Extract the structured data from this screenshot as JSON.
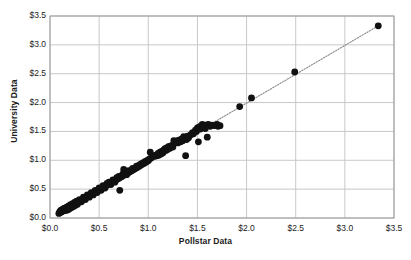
{
  "chart_data": {
    "type": "scatter",
    "title": "",
    "xlabel": "Pollstar Data",
    "ylabel": "University Data",
    "xlim": [
      0,
      3.5
    ],
    "ylim": [
      0,
      3.5
    ],
    "xticks": [
      "$0.0",
      "$0.5",
      "$1.0",
      "$1.5",
      "$2.0",
      "$2.5",
      "$3.0",
      "$3.5"
    ],
    "yticks": [
      "$0.0",
      "$0.5",
      "$1.0",
      "$1.5",
      "$2.0",
      "$2.5",
      "$3.0",
      "$3.5"
    ],
    "xtick_values": [
      0,
      0.5,
      1.0,
      1.5,
      2.0,
      2.5,
      3.0,
      3.5
    ],
    "ytick_values": [
      0,
      0.5,
      1.0,
      1.5,
      2.0,
      2.5,
      3.0,
      3.5
    ],
    "grid": true,
    "legend": "none",
    "marker_color": "#111111",
    "marker_size": 3.4,
    "gridline_color": "#c8c8c8",
    "axis_color": "#9a9a9a",
    "trendline": {
      "style": "dotted",
      "color": "#8c8c8c",
      "x": [
        0.08,
        3.36
      ],
      "y": [
        0.07,
        3.35
      ]
    },
    "series": [
      {
        "name": "Pollstar vs University",
        "points": [
          [
            0.09,
            0.08
          ],
          [
            0.1,
            0.09
          ],
          [
            0.1,
            0.11
          ],
          [
            0.11,
            0.1
          ],
          [
            0.11,
            0.13
          ],
          [
            0.12,
            0.11
          ],
          [
            0.12,
            0.14
          ],
          [
            0.13,
            0.12
          ],
          [
            0.13,
            0.15
          ],
          [
            0.14,
            0.13
          ],
          [
            0.14,
            0.16
          ],
          [
            0.15,
            0.14
          ],
          [
            0.15,
            0.17
          ],
          [
            0.16,
            0.15
          ],
          [
            0.16,
            0.13
          ],
          [
            0.17,
            0.16
          ],
          [
            0.17,
            0.19
          ],
          [
            0.18,
            0.17
          ],
          [
            0.18,
            0.14
          ],
          [
            0.19,
            0.18
          ],
          [
            0.19,
            0.21
          ],
          [
            0.2,
            0.19
          ],
          [
            0.2,
            0.16
          ],
          [
            0.21,
            0.2
          ],
          [
            0.21,
            0.23
          ],
          [
            0.22,
            0.21
          ],
          [
            0.22,
            0.18
          ],
          [
            0.23,
            0.22
          ],
          [
            0.23,
            0.25
          ],
          [
            0.24,
            0.23
          ],
          [
            0.24,
            0.2
          ],
          [
            0.25,
            0.24
          ],
          [
            0.25,
            0.27
          ],
          [
            0.26,
            0.25
          ],
          [
            0.26,
            0.22
          ],
          [
            0.27,
            0.26
          ],
          [
            0.27,
            0.29
          ],
          [
            0.28,
            0.27
          ],
          [
            0.28,
            0.24
          ],
          [
            0.29,
            0.28
          ],
          [
            0.3,
            0.29
          ],
          [
            0.3,
            0.32
          ],
          [
            0.31,
            0.3
          ],
          [
            0.32,
            0.31
          ],
          [
            0.32,
            0.28
          ],
          [
            0.33,
            0.32
          ],
          [
            0.34,
            0.33
          ],
          [
            0.34,
            0.36
          ],
          [
            0.35,
            0.34
          ],
          [
            0.36,
            0.35
          ],
          [
            0.36,
            0.32
          ],
          [
            0.37,
            0.36
          ],
          [
            0.38,
            0.37
          ],
          [
            0.38,
            0.4
          ],
          [
            0.39,
            0.38
          ],
          [
            0.4,
            0.39
          ],
          [
            0.4,
            0.36
          ],
          [
            0.41,
            0.4
          ],
          [
            0.42,
            0.41
          ],
          [
            0.42,
            0.44
          ],
          [
            0.43,
            0.42
          ],
          [
            0.44,
            0.43
          ],
          [
            0.44,
            0.4
          ],
          [
            0.45,
            0.44
          ],
          [
            0.46,
            0.45
          ],
          [
            0.46,
            0.48
          ],
          [
            0.47,
            0.46
          ],
          [
            0.48,
            0.47
          ],
          [
            0.48,
            0.44
          ],
          [
            0.49,
            0.48
          ],
          [
            0.5,
            0.49
          ],
          [
            0.5,
            0.52
          ],
          [
            0.51,
            0.5
          ],
          [
            0.52,
            0.51
          ],
          [
            0.52,
            0.48
          ],
          [
            0.53,
            0.52
          ],
          [
            0.54,
            0.53
          ],
          [
            0.54,
            0.56
          ],
          [
            0.55,
            0.54
          ],
          [
            0.56,
            0.55
          ],
          [
            0.56,
            0.52
          ],
          [
            0.57,
            0.56
          ],
          [
            0.58,
            0.57
          ],
          [
            0.58,
            0.6
          ],
          [
            0.59,
            0.58
          ],
          [
            0.6,
            0.59
          ],
          [
            0.6,
            0.62
          ],
          [
            0.61,
            0.6
          ],
          [
            0.62,
            0.61
          ],
          [
            0.62,
            0.58
          ],
          [
            0.63,
            0.62
          ],
          [
            0.64,
            0.63
          ],
          [
            0.64,
            0.66
          ],
          [
            0.65,
            0.64
          ],
          [
            0.66,
            0.65
          ],
          [
            0.66,
            0.62
          ],
          [
            0.67,
            0.66
          ],
          [
            0.68,
            0.67
          ],
          [
            0.68,
            0.7
          ],
          [
            0.69,
            0.68
          ],
          [
            0.7,
            0.69
          ],
          [
            0.7,
            0.72
          ],
          [
            0.71,
            0.7
          ],
          [
            0.71,
            0.48
          ],
          [
            0.72,
            0.71
          ],
          [
            0.73,
            0.72
          ],
          [
            0.74,
            0.73
          ],
          [
            0.74,
            0.76
          ],
          [
            0.75,
            0.84
          ],
          [
            0.75,
            0.74
          ],
          [
            0.76,
            0.78
          ],
          [
            0.77,
            0.76
          ],
          [
            0.78,
            0.79
          ],
          [
            0.78,
            0.75
          ],
          [
            0.79,
            0.78
          ],
          [
            0.8,
            0.79
          ],
          [
            0.8,
            0.82
          ],
          [
            0.81,
            0.8
          ],
          [
            0.82,
            0.81
          ],
          [
            0.83,
            0.82
          ],
          [
            0.84,
            0.83
          ],
          [
            0.84,
            0.86
          ],
          [
            0.85,
            0.84
          ],
          [
            0.86,
            0.85
          ],
          [
            0.87,
            0.86
          ],
          [
            0.88,
            0.87
          ],
          [
            0.88,
            0.9
          ],
          [
            0.89,
            0.88
          ],
          [
            0.9,
            0.89
          ],
          [
            0.91,
            0.92
          ],
          [
            0.92,
            0.91
          ],
          [
            0.93,
            0.94
          ],
          [
            0.94,
            0.93
          ],
          [
            0.95,
            0.96
          ],
          [
            0.96,
            0.95
          ],
          [
            0.97,
            0.98
          ],
          [
            0.98,
            0.97
          ],
          [
            0.99,
            1.0
          ],
          [
            1.0,
            0.99
          ],
          [
            1.01,
            1.02
          ],
          [
            1.02,
            1.14
          ],
          [
            1.03,
            1.04
          ],
          [
            1.04,
            1.06
          ],
          [
            1.06,
            1.08
          ],
          [
            1.07,
            1.07
          ],
          [
            1.08,
            1.09
          ],
          [
            1.09,
            1.08
          ],
          [
            1.1,
            1.12
          ],
          [
            1.11,
            1.09
          ],
          [
            1.12,
            1.14
          ],
          [
            1.13,
            1.11
          ],
          [
            1.14,
            1.16
          ],
          [
            1.15,
            1.13
          ],
          [
            1.16,
            1.18
          ],
          [
            1.17,
            1.2
          ],
          [
            1.18,
            1.17
          ],
          [
            1.19,
            1.22
          ],
          [
            1.2,
            1.19
          ],
          [
            1.21,
            1.24
          ],
          [
            1.22,
            1.21
          ],
          [
            1.24,
            1.26
          ],
          [
            1.25,
            1.23
          ],
          [
            1.26,
            1.34
          ],
          [
            1.28,
            1.33
          ],
          [
            1.3,
            1.3
          ],
          [
            1.31,
            1.35
          ],
          [
            1.33,
            1.32
          ],
          [
            1.34,
            1.37
          ],
          [
            1.35,
            1.34
          ],
          [
            1.36,
            1.41
          ],
          [
            1.37,
            1.38
          ],
          [
            1.38,
            1.08
          ],
          [
            1.39,
            1.36
          ],
          [
            1.4,
            1.42
          ],
          [
            1.41,
            1.39
          ],
          [
            1.43,
            1.44
          ],
          [
            1.45,
            1.48
          ],
          [
            1.46,
            1.46
          ],
          [
            1.48,
            1.52
          ],
          [
            1.49,
            1.5
          ],
          [
            1.5,
            1.56
          ],
          [
            1.51,
            1.32
          ],
          [
            1.52,
            1.58
          ],
          [
            1.53,
            1.54
          ],
          [
            1.54,
            1.6
          ],
          [
            1.55,
            1.62
          ],
          [
            1.56,
            1.58
          ],
          [
            1.57,
            1.6
          ],
          [
            1.58,
            1.55
          ],
          [
            1.59,
            1.61
          ],
          [
            1.6,
            1.4
          ],
          [
            1.61,
            1.62
          ],
          [
            1.63,
            1.59
          ],
          [
            1.65,
            1.61
          ],
          [
            1.68,
            1.6
          ],
          [
            1.7,
            1.62
          ],
          [
            1.71,
            1.59
          ],
          [
            1.73,
            1.6
          ],
          [
            1.93,
            1.93
          ],
          [
            2.05,
            2.08
          ],
          [
            2.49,
            2.53
          ],
          [
            3.34,
            3.33
          ]
        ]
      }
    ]
  },
  "plot_geometry": {
    "left": 50,
    "top": 16,
    "right": 394,
    "bottom": 218
  }
}
